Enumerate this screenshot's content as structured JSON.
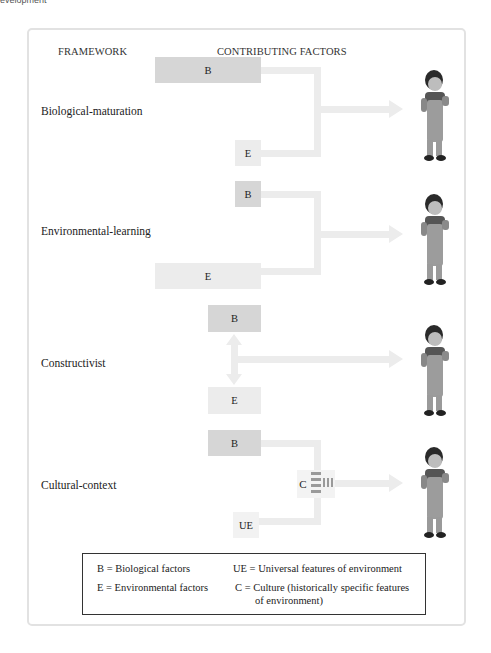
{
  "page": {
    "cropped_header_text": "evelopment"
  },
  "diagram": {
    "headers": {
      "framework": "FRAMEWORK",
      "factors": "CONTRIBUTING FACTORS"
    },
    "frameworks": [
      {
        "label": "Biological-maturation",
        "boxes": [
          {
            "code": "B",
            "size": "large"
          },
          {
            "code": "E",
            "size": "small"
          }
        ],
        "relation": "B and E converge, B dominant"
      },
      {
        "label": "Environmental-learning",
        "boxes": [
          {
            "code": "B",
            "size": "small"
          },
          {
            "code": "E",
            "size": "large"
          }
        ],
        "relation": "B and E converge, E dominant"
      },
      {
        "label": "Constructivist",
        "boxes": [
          {
            "code": "B",
            "size": "medium"
          },
          {
            "code": "E",
            "size": "medium"
          }
        ],
        "relation": "B and E interact bidirectionally"
      },
      {
        "label": "Cultural-context",
        "boxes": [
          {
            "code": "B",
            "size": "medium"
          },
          {
            "code": "UE",
            "size": "small"
          }
        ],
        "mediator": "C",
        "relation": "B and UE filtered through C"
      }
    ],
    "outcome_icon": "child-figure",
    "colors": {
      "biological_box": "#d6d6d6",
      "environment_box": "#ececec",
      "connector": "#ececec",
      "culture_stripes": "#9a9a9a"
    }
  },
  "legend": {
    "b": "B = Biological factors",
    "e": "E = Environmental factors",
    "ue": "UE = Universal features of environment",
    "c_line1": "C = Culture (historically specific features",
    "c_line2": "of environment)"
  }
}
